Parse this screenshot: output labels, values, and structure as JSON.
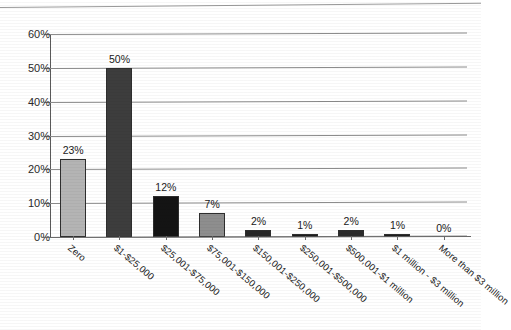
{
  "scan": {
    "cut_off_header_text": ""
  },
  "chart_data": {
    "type": "bar",
    "title": "",
    "xlabel": "",
    "ylabel": "",
    "ylim": [
      0,
      60
    ],
    "ytick_labels": [
      "0%",
      "10%",
      "20%",
      "30%",
      "40%",
      "50%",
      "60%"
    ],
    "ytick_values": [
      0,
      10,
      20,
      30,
      40,
      50,
      60
    ],
    "grid": true,
    "legend": "none",
    "categories": [
      "Zero",
      "$1-$25,000",
      "$25,001-$75,000",
      "$75,001-$150,000",
      "$150,001-$250,000",
      "$250,001-$500,000",
      "$500,001-$1 million",
      "$1 million - $3 million",
      "More than $3 million"
    ],
    "values": [
      23,
      50,
      12,
      7,
      2,
      1,
      2,
      1,
      0
    ],
    "data_labels": [
      "23%",
      "50%",
      "12%",
      "7%",
      "2%",
      "1%",
      "2%",
      "1%",
      "0%"
    ],
    "bar_colors": [
      "#b4b4b4",
      "#3d3d3d",
      "#141414",
      "#8e8e8e",
      "#262626",
      "#1c1c1c",
      "#2b2b2b",
      "#1c1c1c",
      "#ffffff"
    ]
  },
  "colors": {
    "gridline": "#8c8c8c",
    "axis": "#5a5a5a",
    "text": "#1a1a1a",
    "background": "#ffffff"
  }
}
